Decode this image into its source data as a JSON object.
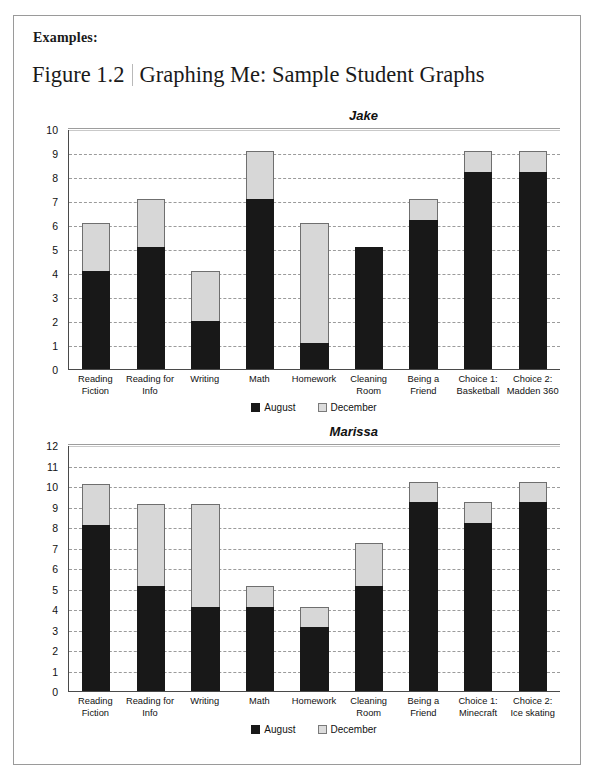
{
  "document": {
    "examples_label": "Examples:",
    "figure_number": "Figure 1.2",
    "figure_title": "Graphing Me: Sample Student Graphs",
    "footer_note": ""
  },
  "legend": {
    "august_label": "August",
    "december_label": "December",
    "august_color": "#181818",
    "december_color": "#d7d7d7"
  },
  "chart_data": [
    {
      "type": "bar",
      "title": "Jake",
      "stacked": true,
      "xlabel": "",
      "ylabel": "",
      "ylim": [
        0,
        10
      ],
      "yticks": [
        0,
        1,
        2,
        3,
        4,
        5,
        6,
        7,
        8,
        9,
        10
      ],
      "grid": true,
      "legend_position": "bottom",
      "categories": [
        "Reading Fiction",
        "Reading for Info",
        "Writing",
        "Math",
        "Homework",
        "Cleaning Room",
        "Being a Friend",
        "Choice 1: Basketball",
        "Choice 2: Madden 360"
      ],
      "series": [
        {
          "name": "August",
          "values": [
            4.1,
            5.1,
            2.0,
            7.1,
            1.1,
            5.1,
            6.2,
            8.2,
            8.2
          ]
        },
        {
          "name": "December",
          "values": [
            2.0,
            2.0,
            2.1,
            2.0,
            5.0,
            0.0,
            0.9,
            0.9,
            0.9
          ]
        }
      ],
      "totals": [
        6.1,
        7.1,
        4.1,
        9.1,
        6.1,
        5.1,
        7.1,
        9.1,
        9.1
      ]
    },
    {
      "type": "bar",
      "title": "Marissa",
      "stacked": true,
      "xlabel": "",
      "ylabel": "",
      "ylim": [
        0,
        12
      ],
      "yticks": [
        0,
        1,
        2,
        3,
        4,
        5,
        6,
        7,
        8,
        9,
        10,
        11,
        12
      ],
      "grid": true,
      "legend_position": "bottom",
      "categories": [
        "Reading Fiction",
        "Reading for Info",
        "Writing",
        "Math",
        "Homework",
        "Cleaning Room",
        "Being a Friend",
        "Choice 1: Minecraft",
        "Choice 2: Ice skating"
      ],
      "series": [
        {
          "name": "August",
          "values": [
            8.1,
            5.1,
            4.1,
            4.1,
            3.1,
            5.1,
            9.2,
            8.2,
            9.2
          ]
        },
        {
          "name": "December",
          "values": [
            2.0,
            4.0,
            5.0,
            1.0,
            1.0,
            2.1,
            1.0,
            1.0,
            1.0
          ]
        }
      ],
      "totals": [
        10.1,
        9.1,
        9.1,
        5.1,
        4.1,
        7.2,
        10.2,
        9.2,
        10.2
      ]
    }
  ]
}
